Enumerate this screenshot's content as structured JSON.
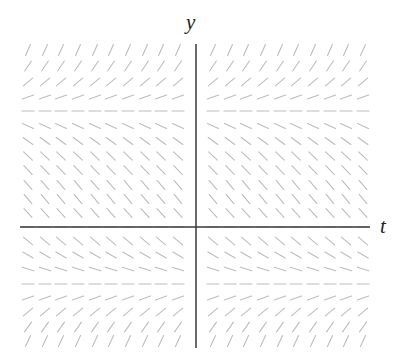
{
  "chart_data": {
    "type": "slope_field",
    "title": "",
    "xlabel": "t",
    "ylabel": "y",
    "grid": false,
    "legend": null,
    "axis_tick_labels": [],
    "equilibria_rows": [
      "upper (y ≈ +c)",
      "y = 0",
      "lower (y ≈ -c)"
    ],
    "columns_x_px": [
      28,
      45,
      61,
      78,
      95,
      111,
      128,
      145,
      161,
      178,
      213,
      230,
      246,
      263,
      280,
      296,
      313,
      330,
      346,
      363
    ],
    "rows": [
      {
        "y_px": 50,
        "angle_deg": 66
      },
      {
        "y_px": 66,
        "angle_deg": 56
      },
      {
        "y_px": 82,
        "angle_deg": 40
      },
      {
        "y_px": 97,
        "angle_deg": 20
      },
      {
        "y_px": 111,
        "angle_deg": 0
      },
      {
        "y_px": 126,
        "angle_deg": -24
      },
      {
        "y_px": 141,
        "angle_deg": -36
      },
      {
        "y_px": 156,
        "angle_deg": -43
      },
      {
        "y_px": 170,
        "angle_deg": -46
      },
      {
        "y_px": 185,
        "angle_deg": -49
      },
      {
        "y_px": 199,
        "angle_deg": -50
      },
      {
        "y_px": 213,
        "angle_deg": -48
      },
      {
        "y_px": 227,
        "angle_deg": 0
      },
      {
        "y_px": 241,
        "angle_deg": -40
      },
      {
        "y_px": 255,
        "angle_deg": -30
      },
      {
        "y_px": 269,
        "angle_deg": -18
      },
      {
        "y_px": 284,
        "angle_deg": 0
      },
      {
        "y_px": 298,
        "angle_deg": 20
      },
      {
        "y_px": 312,
        "angle_deg": 40
      },
      {
        "y_px": 327,
        "angle_deg": 55
      },
      {
        "y_px": 341,
        "angle_deg": 65
      }
    ],
    "segment_length_px": 12,
    "axes": {
      "y_axis": {
        "x_px": 196,
        "y_from_px": 44,
        "y_to_px": 348
      },
      "t_axis": {
        "y_px": 227,
        "x_from_px": 20,
        "x_to_px": 370
      }
    }
  },
  "labels": {
    "y_axis": "y",
    "t_axis": "t"
  },
  "colors": {
    "segment": "#bdbdbd",
    "axis": "#3a3a3a",
    "background": "#ffffff"
  }
}
